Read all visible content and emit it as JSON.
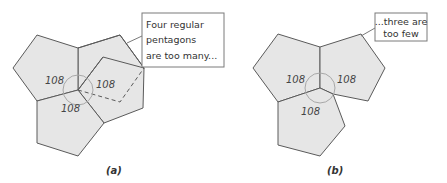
{
  "panels": [
    {
      "id": "a",
      "label": "(a)",
      "callout": {
        "lines": [
          "Four regular",
          "pentagons",
          "are too many..."
        ]
      },
      "angles": [
        "108",
        "108",
        "108"
      ]
    },
    {
      "id": "b",
      "label": "(b)",
      "callout": {
        "lines": [
          "...three are",
          "too few"
        ]
      },
      "angles": [
        "108",
        "108",
        "108"
      ]
    }
  ],
  "colors": {
    "pentagon_fill": "#e6e6e6",
    "pentagon_stroke": "#5a5a5a",
    "arc": "#a8a8a8"
  }
}
